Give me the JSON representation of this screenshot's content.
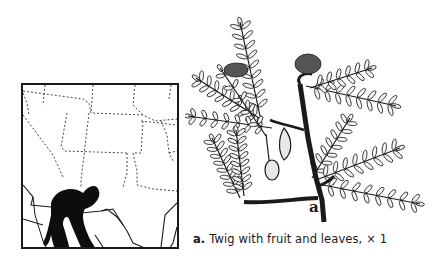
{
  "map": {
    "title": "Range map",
    "colors": {
      "border": "#1a1a1a",
      "range_fill": "#0d0d0d",
      "background": "#ffffff"
    }
  },
  "figure": {
    "label": "a",
    "caption": {
      "letter": "a.",
      "text": "Twig with fruit and leaves,",
      "scale_symbol": "×",
      "scale_value": "1"
    }
  },
  "twig": {
    "pinnae": [
      {
        "x1": 60,
        "y1": 108,
        "x2": 40,
        "y2": 14,
        "n": 9,
        "len": 9
      },
      {
        "x1": 62,
        "y1": 112,
        "x2": -4,
        "y2": 70,
        "n": 8,
        "len": 8
      },
      {
        "x1": 72,
        "y1": 120,
        "x2": -12,
        "y2": 108,
        "n": 7,
        "len": 7
      },
      {
        "x1": 66,
        "y1": 128,
        "x2": 20,
        "y2": 60,
        "n": 5,
        "len": 7
      },
      {
        "x1": 40,
        "y1": 190,
        "x2": 12,
        "y2": 130,
        "n": 8,
        "len": 8
      },
      {
        "x1": 44,
        "y1": 188,
        "x2": 36,
        "y2": 122,
        "n": 8,
        "len": 8
      },
      {
        "x1": 106,
        "y1": 78,
        "x2": 196,
        "y2": 98,
        "n": 8,
        "len": 9
      },
      {
        "x1": 110,
        "y1": 80,
        "x2": 172,
        "y2": 60,
        "n": 6,
        "len": 8
      },
      {
        "x1": 112,
        "y1": 170,
        "x2": 150,
        "y2": 110,
        "n": 7,
        "len": 8
      },
      {
        "x1": 116,
        "y1": 172,
        "x2": 200,
        "y2": 140,
        "n": 8,
        "len": 9
      },
      {
        "x1": 118,
        "y1": 176,
        "x2": 220,
        "y2": 196,
        "n": 8,
        "len": 8
      }
    ]
  }
}
